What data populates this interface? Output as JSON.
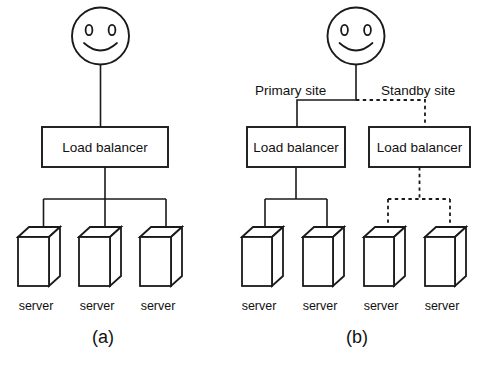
{
  "figure": {
    "background_color": "#ffffff",
    "line_color": "#1a1a1a",
    "text_color": "#111111"
  },
  "panel_a": {
    "caption": "(a)",
    "actor": {
      "icon": "smiley-face-user-icon"
    },
    "load_balancer": {
      "label": "Load balancer"
    },
    "servers": [
      {
        "label": "server"
      },
      {
        "label": "server"
      },
      {
        "label": "server"
      }
    ]
  },
  "panel_b": {
    "caption": "(b)",
    "actor": {
      "icon": "smiley-face-user-icon"
    },
    "site_labels": {
      "primary": "Primary site",
      "standby": "Standby site"
    },
    "primary": {
      "load_balancer": {
        "label": "Load balancer"
      },
      "servers": [
        {
          "label": "server"
        },
        {
          "label": "server"
        }
      ]
    },
    "standby": {
      "load_balancer": {
        "label": "Load balancer"
      },
      "servers": [
        {
          "label": "server"
        },
        {
          "label": "server"
        }
      ]
    }
  }
}
